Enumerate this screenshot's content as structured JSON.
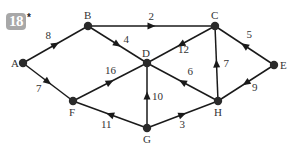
{
  "problem": {
    "number": "18",
    "marker": "*"
  },
  "graph": {
    "directed": true,
    "nodes": [
      {
        "id": "A",
        "label": "A"
      },
      {
        "id": "B",
        "label": "B"
      },
      {
        "id": "C",
        "label": "C"
      },
      {
        "id": "D",
        "label": "D"
      },
      {
        "id": "E",
        "label": "E"
      },
      {
        "id": "F",
        "label": "F"
      },
      {
        "id": "G",
        "label": "G"
      },
      {
        "id": "H",
        "label": "H"
      }
    ],
    "edges": [
      {
        "from": "A",
        "to": "B",
        "weight": "8"
      },
      {
        "from": "A",
        "to": "F",
        "weight": "7"
      },
      {
        "from": "B",
        "to": "C",
        "weight": "2"
      },
      {
        "from": "B",
        "to": "D",
        "weight": "4"
      },
      {
        "from": "C",
        "to": "D",
        "weight": "12"
      },
      {
        "from": "E",
        "to": "C",
        "weight": "5"
      },
      {
        "from": "H",
        "to": "C",
        "weight": "7"
      },
      {
        "from": "F",
        "to": "D",
        "weight": "16"
      },
      {
        "from": "G",
        "to": "F",
        "weight": "11"
      },
      {
        "from": "G",
        "to": "D",
        "weight": "10"
      },
      {
        "from": "H",
        "to": "D",
        "weight": "6"
      },
      {
        "from": "G",
        "to": "H",
        "weight": "3"
      },
      {
        "from": "E",
        "to": "H",
        "weight": "9"
      }
    ]
  }
}
